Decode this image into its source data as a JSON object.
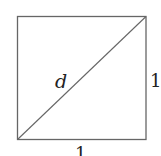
{
  "diagram": {
    "shape": "square",
    "labels": {
      "diagonal": "d",
      "right_side": "1",
      "bottom_side": "1"
    },
    "colors": {
      "stroke": "#666666",
      "text": "#222222"
    }
  }
}
